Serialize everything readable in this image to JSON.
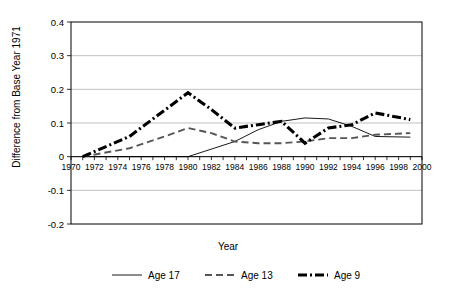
{
  "chart_data": {
    "type": "line",
    "title": "",
    "xlabel": "Year",
    "ylabel": "Difference from Base Year 1971",
    "xlim": [
      1970,
      2000
    ],
    "ylim": [
      -0.2,
      0.4
    ],
    "ytick_values": [
      0.4,
      0.3,
      0.2,
      0.1,
      0,
      -0.1,
      -0.2
    ],
    "ytick_labels": [
      "0.4",
      "0.3",
      "0.2",
      "0.1",
      "0",
      "-0.1",
      "-0.2"
    ],
    "xtick_values": [
      1970,
      1972,
      1974,
      1976,
      1978,
      1980,
      1982,
      1984,
      1986,
      1988,
      1990,
      1992,
      1994,
      1996,
      1998,
      2000
    ],
    "xtick_labels": [
      "1970",
      "1972",
      "1974",
      "1976",
      "1978",
      "1980",
      "1982",
      "1984",
      "1986",
      "1988",
      "1990",
      "1992",
      "1994",
      "1996",
      "1998",
      "2000"
    ],
    "grid": true,
    "grid_axis": "y",
    "legend_position": "bottom",
    "series": [
      {
        "name": "Age 17",
        "style": "solid-thin",
        "color": "#000000",
        "x": [
          1971,
          1975,
          1980,
          1984,
          1986,
          1988,
          1990,
          1992,
          1994,
          1996,
          1999
        ],
        "values": [
          0.0,
          0.0,
          0.0,
          0.045,
          0.08,
          0.105,
          0.115,
          0.112,
          0.09,
          0.06,
          0.058
        ]
      },
      {
        "name": "Age 13",
        "style": "dashed",
        "color": "#555555",
        "x": [
          1971,
          1975,
          1978,
          1980,
          1982,
          1984,
          1986,
          1988,
          1990,
          1992,
          1994,
          1996,
          1999
        ],
        "values": [
          0.0,
          0.025,
          0.06,
          0.085,
          0.07,
          0.045,
          0.04,
          0.04,
          0.045,
          0.055,
          0.055,
          0.065,
          0.07
        ]
      },
      {
        "name": "Age 9",
        "style": "thick-dash-dot",
        "color": "#000000",
        "x": [
          1971,
          1975,
          1980,
          1982,
          1984,
          1986,
          1988,
          1990,
          1992,
          1994,
          1996,
          1999
        ],
        "values": [
          0.0,
          0.06,
          0.19,
          0.14,
          0.085,
          0.095,
          0.105,
          0.04,
          0.085,
          0.095,
          0.13,
          0.11
        ]
      }
    ]
  },
  "legend": {
    "items": [
      {
        "label": "Age 17"
      },
      {
        "label": "Age 13"
      },
      {
        "label": "Age 9"
      }
    ]
  }
}
